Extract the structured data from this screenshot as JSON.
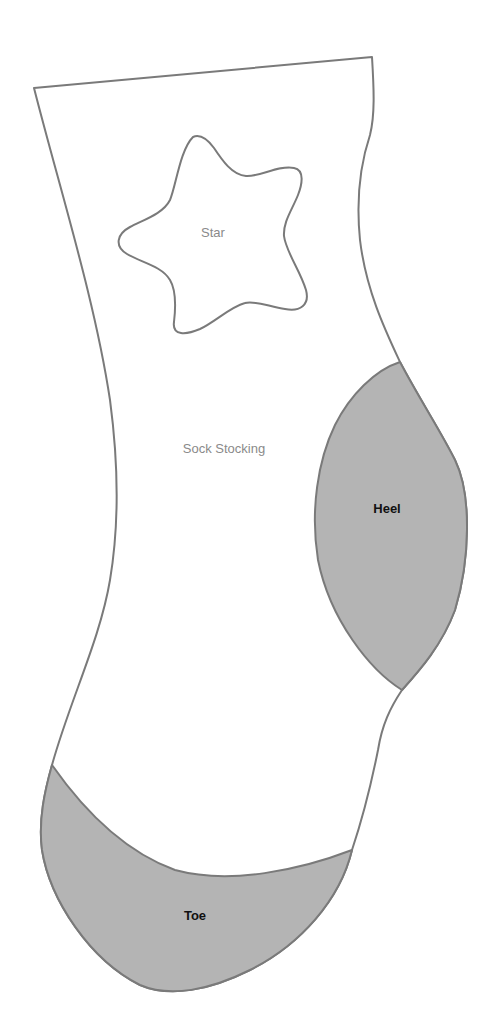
{
  "diagram": {
    "type": "sewing-pattern",
    "pieces": [
      {
        "id": "sock",
        "label": "Sock Stocking",
        "fill": "#ffffff",
        "stroke": "#7a7a7a"
      },
      {
        "id": "star",
        "label": "Star",
        "fill": "#ffffff",
        "stroke": "#7a7a7a"
      },
      {
        "id": "heel",
        "label": "Heel",
        "fill": "#b4b4b4",
        "stroke": "#7a7a7a"
      },
      {
        "id": "toe",
        "label": "Toe",
        "fill": "#b4b4b4",
        "stroke": "#7a7a7a"
      }
    ]
  },
  "labels": {
    "sock": "Sock Stocking",
    "star": "Star",
    "heel": "Heel",
    "toe": "Toe"
  },
  "colors": {
    "outline": "#7a7a7a",
    "patch_fill": "#b4b4b4",
    "background": "#ffffff"
  }
}
